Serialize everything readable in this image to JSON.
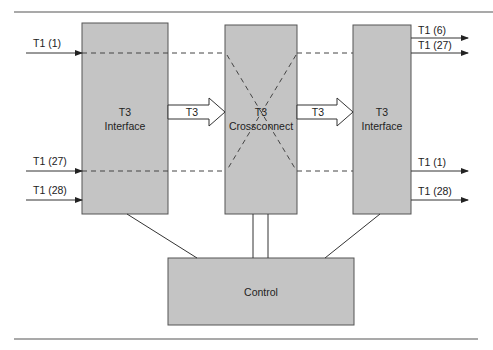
{
  "diagram": {
    "left_interface": {
      "line1": "T3",
      "line2": "Interface"
    },
    "crossconnect": {
      "line1": "T3",
      "line2": "Crossconnect"
    },
    "right_interface": {
      "line1": "T3",
      "line2": "Interface"
    },
    "control": {
      "label": "Control"
    },
    "link_left": {
      "label": "T3"
    },
    "link_right": {
      "label": "T3"
    },
    "inputs": [
      {
        "label": "T1 (1)"
      },
      {
        "label": "T1 (27)"
      },
      {
        "label": "T1 (28)"
      }
    ],
    "outputs": [
      {
        "label": "T1 (6)"
      },
      {
        "label": "T1 (27)"
      },
      {
        "label": "T1 (1)"
      },
      {
        "label": "T1 (28)"
      }
    ]
  },
  "colors": {
    "box_fill": "#c4c4c4",
    "stroke": "#333333",
    "background": "#ffffff"
  }
}
